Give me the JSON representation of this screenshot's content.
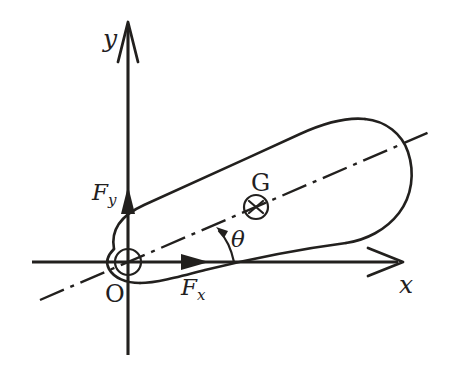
{
  "figure": {
    "background_color": "#ffffff",
    "ink_color": "#22201e",
    "width": 450,
    "height": 371
  },
  "axes": {
    "x": {
      "label": "x",
      "label_name": "x-axis-label",
      "arrow_style": "open-v",
      "origin": {
        "x": 128,
        "y": 262
      },
      "start": {
        "x": 32,
        "y": 262
      },
      "end": {
        "x": 400,
        "y": 262
      }
    },
    "y": {
      "label": "y",
      "label_name": "y-axis-label",
      "arrow_style": "open-v",
      "start": {
        "x": 128,
        "y": 355
      },
      "end": {
        "x": 128,
        "y": 22
      }
    }
  },
  "origin": {
    "label": "O",
    "marker": "circle-with-cross",
    "center": {
      "x": 128,
      "y": 262
    },
    "radius": 13
  },
  "centre_of_gravity": {
    "label": "G",
    "marker": "circle-with-x",
    "center": {
      "x": 256,
      "y": 207
    },
    "radius": 12
  },
  "forces": [
    {
      "label": "F",
      "subscript": "y",
      "name": "force-fy",
      "direction": "up",
      "along": "y-axis",
      "arrow_tip": {
        "x": 128,
        "y": 188
      }
    },
    {
      "label": "F",
      "subscript": "x",
      "name": "force-fx",
      "direction": "right",
      "along": "x-axis",
      "arrow_tip": {
        "x": 207,
        "y": 262
      }
    }
  ],
  "angle": {
    "label": "θ",
    "name": "angle-theta",
    "between": [
      "x-axis",
      "body-axis"
    ],
    "vertex": {
      "x": 128,
      "y": 262
    },
    "arc_start": {
      "x": 233,
      "y": 262
    },
    "arc_end": {
      "x": 218,
      "y": 229
    },
    "arrow_at": "arc-end"
  },
  "body_axis": {
    "name": "body-centre-axis",
    "line_style": "dash-dot",
    "start": {
      "x": 40,
      "y": 300
    },
    "end": {
      "x": 432,
      "y": 131
    },
    "passes_through": [
      "origin",
      "centre-of-gravity"
    ]
  },
  "body": {
    "name": "rigid-body-outline",
    "shape": "tapered-blob",
    "description": "Narrow rounded tip at the origin widening to a large rounded bulge at the upper right, tilted along the body axis."
  }
}
